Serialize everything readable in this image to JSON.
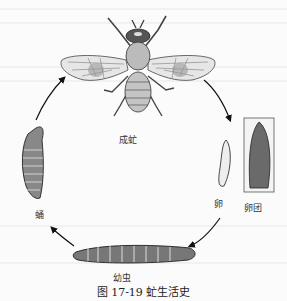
{
  "figure": {
    "caption": "图 17-19   虻生活史",
    "stages": {
      "adult": "成虻",
      "egg": "卵",
      "egg_mass": "卵团",
      "larva": "幼虫",
      "pupa": "蛹"
    },
    "cycle_order": [
      "成虻",
      "卵",
      "幼虫",
      "蛹",
      "成虻"
    ]
  }
}
